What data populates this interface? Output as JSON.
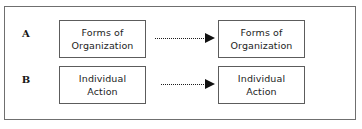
{
  "figure": {
    "background_color": "#ffffff",
    "frame_color": "#6f6f6f",
    "box_border_color": "#5c5c5c",
    "arrow_color": "#111111",
    "text_color": "#232323",
    "rows": [
      {
        "label": "A",
        "source": "Forms of\nOrganization",
        "target": "Forms of\nOrganization",
        "connector": "dotted-arrow-right"
      },
      {
        "label": "B",
        "source": "Individual\nAction",
        "target": "Individual\nAction",
        "connector": "dotted-arrow-right"
      }
    ]
  }
}
